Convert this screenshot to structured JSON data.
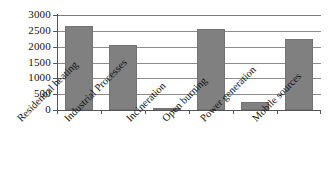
{
  "chart_data": {
    "type": "bar",
    "title": "",
    "subtitle": "",
    "xlabel": "",
    "ylabel": "",
    "categories": [
      "Residential heating",
      "Industrial Processes",
      "Incineration",
      "Open burning",
      "Power generation",
      "Mobile sources"
    ],
    "values": [
      2660,
      2060,
      35,
      2570,
      250,
      2230
    ],
    "ylim": [
      0,
      3000
    ],
    "yticks": [
      0,
      500,
      1000,
      1500,
      2000,
      2500,
      3000
    ],
    "ytick_labels": [
      "0",
      "500",
      "1000",
      "1500",
      "2000",
      "2500",
      "3000"
    ],
    "grid": true,
    "grid_axis": "y",
    "legend": false,
    "legend_position": "none",
    "series": [
      {
        "name": "",
        "values": [
          2660,
          2060,
          35,
          2570,
          250,
          2230
        ]
      }
    ],
    "colors": {
      "bar_fill": "#808080",
      "bar_edge": "#737373",
      "gridline": "#8c8c8c",
      "axis": "#555555",
      "text": "#111111",
      "background": "#ffffff"
    }
  }
}
